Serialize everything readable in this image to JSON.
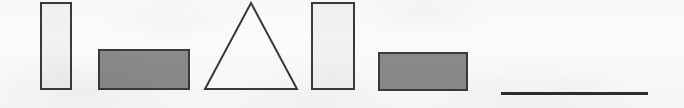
{
  "figure": {
    "background_color": "#fbfbfa",
    "outline_color": "#3a3a3a",
    "light_fill_color": "#f2f2f0",
    "dark_fill_color": "#8a8a8a",
    "line_color": "#2e2e2e",
    "canvas": {
      "width": 684,
      "height": 108
    }
  },
  "shapes": [
    {
      "id": "shape-1",
      "name": "tall-light-rectangle-1",
      "type": "rectangle",
      "fill": "#f2f2f0",
      "stroke": "#3a3a3a",
      "stroke_width": 2,
      "x": 40,
      "y": 2,
      "width": 32,
      "height": 88
    },
    {
      "id": "shape-2",
      "name": "wide-dark-rectangle-1",
      "type": "rectangle",
      "fill": "#8a8a8a",
      "stroke": "#3a3a3a",
      "stroke_width": 2,
      "x": 98,
      "y": 49,
      "width": 92,
      "height": 41
    },
    {
      "id": "shape-3",
      "name": "unfilled-triangle",
      "type": "triangle",
      "fill": "none",
      "stroke": "#3a3a3a",
      "stroke_width": 2,
      "x": 203,
      "y": 1,
      "width": 96,
      "height": 90
    },
    {
      "id": "shape-4",
      "name": "tall-light-rectangle-2",
      "type": "rectangle",
      "fill": "#f2f2f0",
      "stroke": "#3a3a3a",
      "stroke_width": 2,
      "x": 311,
      "y": 2,
      "width": 44,
      "height": 88
    },
    {
      "id": "shape-5",
      "name": "wide-dark-rectangle-2",
      "type": "rectangle",
      "fill": "#8a8a8a",
      "stroke": "#3a3a3a",
      "stroke_width": 2,
      "x": 378,
      "y": 52,
      "width": 90,
      "height": 39
    },
    {
      "id": "shape-6",
      "name": "horizontal-line-segment",
      "type": "line",
      "fill": "none",
      "stroke": "#2e2e2e",
      "stroke_width": 3,
      "x": 501,
      "y": 92,
      "width": 147,
      "height": 3
    }
  ]
}
